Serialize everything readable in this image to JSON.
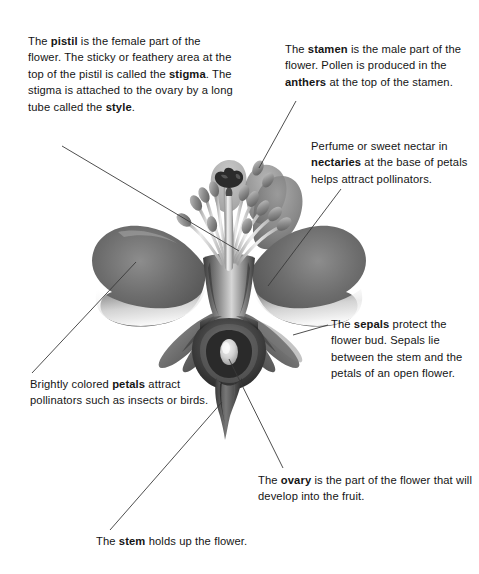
{
  "diagram": {
    "line_color": "#3a3a3a",
    "background_color": "#ffffff",
    "text_color": "#151515"
  },
  "callouts": [
    {
      "id": "pistil",
      "name": "pistil-callout",
      "segments": [
        {
          "text": "The ",
          "bold": false
        },
        {
          "text": "pistil",
          "bold": true
        },
        {
          "text": " is the female part of the flower. The sticky or feathery area at the top of the pistil is called the ",
          "bold": false
        },
        {
          "text": "stigma",
          "bold": true
        },
        {
          "text": ". The stigma is attached to the ovary by a long tube called the ",
          "bold": false
        },
        {
          "text": "style",
          "bold": true
        },
        {
          "text": ".",
          "bold": false
        }
      ],
      "plain": "The pistil is the female part of the flower. The sticky or feathery area at the top of the pistil is called the stigma. The stigma is attached to the ovary by a long tube called the style."
    },
    {
      "id": "stamen",
      "name": "stamen-callout",
      "segments": [
        {
          "text": "The ",
          "bold": false
        },
        {
          "text": "stamen",
          "bold": true
        },
        {
          "text": " is the male part of the flower. Pollen is produced in the ",
          "bold": false
        },
        {
          "text": "anthers",
          "bold": true
        },
        {
          "text": " at the top of the stamen.",
          "bold": false
        }
      ],
      "plain": "The stamen is the male part of the flower. Pollen is produced in the anthers at the top of the stamen."
    },
    {
      "id": "nectary",
      "name": "nectary-callout",
      "segments": [
        {
          "text": "Perfume or sweet nectar in ",
          "bold": false
        },
        {
          "text": "nectaries",
          "bold": true
        },
        {
          "text": " at the base of petals helps attract pollinators.",
          "bold": false
        }
      ],
      "plain": "Perfume or sweet nectar in nectaries at the base of petals helps attract pollinators."
    },
    {
      "id": "sepals",
      "name": "sepals-callout",
      "segments": [
        {
          "text": "The ",
          "bold": false
        },
        {
          "text": "sepals",
          "bold": true
        },
        {
          "text": " protect the flower bud. Sepals lie between the stem and the petals of an open flower.",
          "bold": false
        }
      ],
      "plain": "The sepals protect the flower bud. Sepals lie between the stem and the petals of an open flower."
    },
    {
      "id": "petals",
      "name": "petals-callout",
      "segments": [
        {
          "text": "Brightly colored ",
          "bold": false
        },
        {
          "text": "petals",
          "bold": true
        },
        {
          "text": " attract pollinators such as insects or birds.",
          "bold": false
        }
      ],
      "plain": "Brightly colored petals attract pollinators such as insects or birds."
    },
    {
      "id": "ovary",
      "name": "ovary-callout",
      "segments": [
        {
          "text": "The ",
          "bold": false
        },
        {
          "text": "ovary",
          "bold": true
        },
        {
          "text": " is the part of the flower that will develop into the fruit.",
          "bold": false
        }
      ],
      "plain": "The ovary is the part of the flower that will develop into the fruit."
    },
    {
      "id": "stem",
      "name": "stem-callout",
      "segments": [
        {
          "text": "The ",
          "bold": false
        },
        {
          "text": "stem",
          "bold": true
        },
        {
          "text": " holds up the flower.",
          "bold": false
        }
      ],
      "plain": "The stem holds up the flower."
    }
  ],
  "labeled_parts": [
    "pistil",
    "stigma",
    "style",
    "stamen",
    "anthers",
    "nectaries",
    "sepals",
    "petals",
    "ovary",
    "stem"
  ],
  "leader_lines": [
    {
      "part": "pistil",
      "from": [
        62,
        146
      ],
      "to": [
        239,
        251
      ]
    },
    {
      "part": "stamen",
      "from": [
        296,
        101
      ],
      "to": [
        259,
        168
      ]
    },
    {
      "part": "nectary",
      "from": [
        341,
        189
      ],
      "to": [
        268,
        286
      ]
    },
    {
      "part": "sepals",
      "from": [
        328,
        325
      ],
      "to": [
        293,
        335
      ]
    },
    {
      "part": "petals",
      "from": [
        32,
        373
      ],
      "to": [
        136,
        262
      ]
    },
    {
      "part": "ovary",
      "from": [
        283,
        468
      ],
      "to": [
        229,
        359
      ]
    },
    {
      "part": "stem",
      "from": [
        110,
        530
      ],
      "to": [
        222,
        402
      ]
    }
  ],
  "artwork": {
    "style": "grayscale-airbrush-illustration",
    "tones": {
      "petal_mid": "#6e6e6e",
      "petal_dark": "#4a4a4a",
      "petal_light": "#b9b9b9",
      "sepal": "#6a6a6a",
      "filament": "#cfcfcf",
      "anther": "#8c8c8c",
      "stigma": "#2e2e2e",
      "ovary_wall": "#3a3a3a",
      "ovule": "#d8d8d8",
      "stem": "#555555"
    }
  }
}
